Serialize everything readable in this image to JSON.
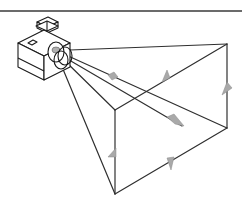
{
  "diagram": {
    "title": "",
    "colors": {
      "line": "#2f2f2f",
      "arrow_fill": "#a9a9a9",
      "camera_stroke": "#1a1a1a",
      "background": "#ffffff"
    },
    "components": [
      {
        "name": "top-rule",
        "label": ""
      },
      {
        "name": "camera",
        "label": ""
      },
      {
        "name": "frustum",
        "label": ""
      },
      {
        "name": "direction-arrows",
        "label": ""
      }
    ]
  }
}
